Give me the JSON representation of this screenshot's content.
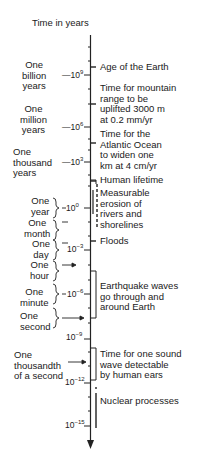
{
  "title": "Time in years",
  "axis": {
    "ticks": [
      {
        "base": "10",
        "exp": "9",
        "y": 75
      },
      {
        "base": "10",
        "exp": "6",
        "y": 127
      },
      {
        "base": "10",
        "exp": "3",
        "y": 162
      },
      {
        "base": "10",
        "exp": "0",
        "y": 208
      },
      {
        "base": "10",
        "exp": "−3",
        "y": 250
      },
      {
        "base": "10",
        "exp": "−6",
        "y": 294
      },
      {
        "base": "10",
        "exp": "−9",
        "y": 339
      },
      {
        "base": "10",
        "exp": "−12",
        "y": 383
      },
      {
        "base": "10",
        "exp": "−15",
        "y": 426
      }
    ]
  },
  "left_labels": [
    {
      "lines": [
        "One",
        "billion",
        "years"
      ]
    },
    {
      "lines": [
        "One",
        "million",
        "years"
      ]
    },
    {
      "lines": [
        "One",
        "thousand",
        "years"
      ]
    },
    {
      "lines": [
        "One",
        "year"
      ]
    },
    {
      "lines": [
        "One",
        "month"
      ]
    },
    {
      "lines": [
        "One",
        "day"
      ]
    },
    {
      "lines": [
        "One",
        "hour"
      ]
    },
    {
      "lines": [
        "One",
        "minute"
      ]
    },
    {
      "lines": [
        "One",
        "second"
      ]
    },
    {
      "lines": [
        "One",
        "thousandth",
        "of a second"
      ]
    }
  ],
  "events": [
    {
      "lines": [
        "Age of the Earth"
      ]
    },
    {
      "lines": [
        "Time for mountain",
        "range to be",
        "uplifted 3000 m",
        "at 0.2 mm/yr"
      ]
    },
    {
      "lines": [
        "Time for the",
        "Atlantic Ocean",
        "to widen one",
        "km at 4 cm/yr"
      ]
    },
    {
      "lines": [
        "Human lifetime"
      ]
    },
    {
      "lines": [
        "Measurable",
        "erosion of",
        "rivers and",
        "shorelines"
      ]
    },
    {
      "lines": [
        "Floods"
      ]
    },
    {
      "lines": [
        "Earthquake waves",
        "go through and",
        "around Earth"
      ]
    },
    {
      "lines": [
        "Time for one sound",
        "wave detectable",
        "by human ears"
      ]
    },
    {
      "lines": [
        "Nuclear processes"
      ]
    }
  ]
}
